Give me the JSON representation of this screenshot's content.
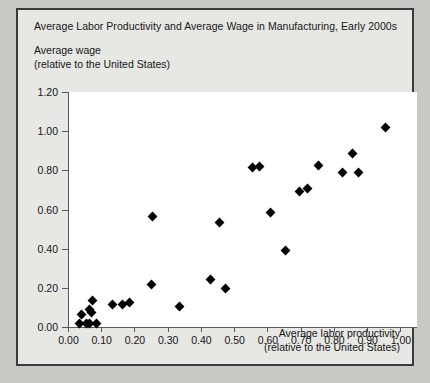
{
  "chart_data": {
    "type": "scatter",
    "title": "Average Labor Productivity and Average Wage in Manufacturing, Early 2000s",
    "ylabel_line1": "Average wage",
    "ylabel_line2": "(relative to the United States)",
    "xlabel_line1": "Average labor productivity",
    "xlabel_line2": "(relative to the United States)",
    "xlim": [
      0.0,
      1.05
    ],
    "ylim": [
      0.0,
      1.2
    ],
    "xticks": [
      "0.00",
      "0.10",
      "0.20",
      "0.30",
      "0.40",
      "0.50",
      "0.60",
      "0.70",
      "0.80",
      "0.90",
      "1.00"
    ],
    "xtick_values": [
      0.0,
      0.1,
      0.2,
      0.3,
      0.4,
      0.5,
      0.6,
      0.7,
      0.8,
      0.9,
      1.0
    ],
    "yticks": [
      "0.00",
      "0.20",
      "0.40",
      "0.60",
      "0.80",
      "1.00",
      "1.20"
    ],
    "ytick_values": [
      0.0,
      0.2,
      0.4,
      0.6,
      0.8,
      1.0,
      1.2
    ],
    "grid": false,
    "legend": null,
    "marker": "diamond",
    "marker_color": "#000000",
    "points": [
      {
        "x": 0.035,
        "y": 0.02
      },
      {
        "x": 0.04,
        "y": 0.065
      },
      {
        "x": 0.055,
        "y": 0.02
      },
      {
        "x": 0.065,
        "y": 0.02
      },
      {
        "x": 0.065,
        "y": 0.09
      },
      {
        "x": 0.07,
        "y": 0.075
      },
      {
        "x": 0.075,
        "y": 0.135
      },
      {
        "x": 0.085,
        "y": 0.02
      },
      {
        "x": 0.135,
        "y": 0.115
      },
      {
        "x": 0.165,
        "y": 0.115
      },
      {
        "x": 0.185,
        "y": 0.125
      },
      {
        "x": 0.25,
        "y": 0.215
      },
      {
        "x": 0.255,
        "y": 0.565
      },
      {
        "x": 0.335,
        "y": 0.105
      },
      {
        "x": 0.43,
        "y": 0.245
      },
      {
        "x": 0.455,
        "y": 0.535
      },
      {
        "x": 0.475,
        "y": 0.195
      },
      {
        "x": 0.555,
        "y": 0.815
      },
      {
        "x": 0.575,
        "y": 0.82
      },
      {
        "x": 0.61,
        "y": 0.585
      },
      {
        "x": 0.655,
        "y": 0.39
      },
      {
        "x": 0.695,
        "y": 0.69
      },
      {
        "x": 0.72,
        "y": 0.705
      },
      {
        "x": 0.755,
        "y": 0.825
      },
      {
        "x": 0.825,
        "y": 0.79
      },
      {
        "x": 0.855,
        "y": 0.885
      },
      {
        "x": 0.875,
        "y": 0.79
      },
      {
        "x": 0.955,
        "y": 1.02
      }
    ]
  }
}
